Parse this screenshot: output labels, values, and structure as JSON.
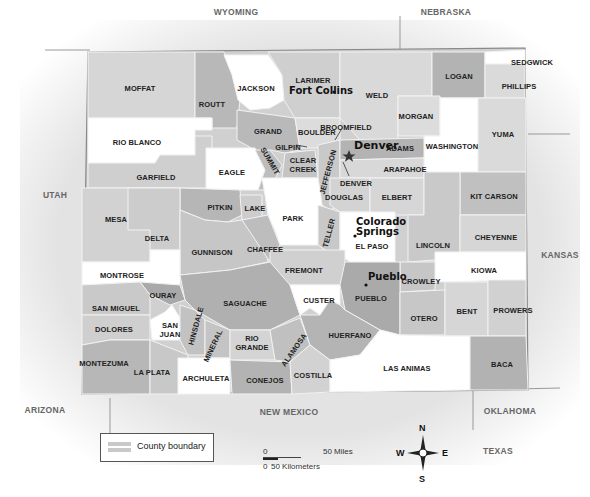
{
  "map": {
    "states": [
      {
        "name": "WYOMING",
        "x": 236,
        "y": 12
      },
      {
        "name": "NEBRASKA",
        "x": 446,
        "y": 12
      },
      {
        "name": "UTAH",
        "x": 55,
        "y": 195
      },
      {
        "name": "KANSAS",
        "x": 560,
        "y": 255
      },
      {
        "name": "ARIZONA",
        "x": 45,
        "y": 410
      },
      {
        "name": "NEW MEXICO",
        "x": 289,
        "y": 412
      },
      {
        "name": "OKLAHOMA",
        "x": 510,
        "y": 411
      },
      {
        "name": "TEXAS",
        "x": 498,
        "y": 451
      }
    ],
    "counties": [
      {
        "name": "MOFFAT",
        "x": 140,
        "y": 88
      },
      {
        "name": "JACKSON",
        "x": 256,
        "y": 88
      },
      {
        "name": "LARIMER",
        "x": 313,
        "y": 80
      },
      {
        "name": "WELD",
        "x": 377,
        "y": 95
      },
      {
        "name": "LOGAN",
        "x": 459,
        "y": 76
      },
      {
        "name": "SEDGWICK",
        "x": 532,
        "y": 62
      },
      {
        "name": "PHILLIPS",
        "x": 519,
        "y": 86
      },
      {
        "name": "ROUTT",
        "x": 212,
        "y": 104
      },
      {
        "name": "MORGAN",
        "x": 416,
        "y": 116
      },
      {
        "name": "RIO BLANCO",
        "x": 137,
        "y": 142
      },
      {
        "name": "GRAND",
        "x": 268,
        "y": 131
      },
      {
        "name": "BOULDER",
        "x": 317,
        "y": 132
      },
      {
        "name": "BROOMFIELD",
        "x": 346,
        "y": 127
      },
      {
        "name": "YUMA",
        "x": 503,
        "y": 134
      },
      {
        "name": "GILPIN",
        "x": 288,
        "y": 147
      },
      {
        "name": "ADAMS",
        "x": 400,
        "y": 148
      },
      {
        "name": "WASHINGTON",
        "x": 452,
        "y": 146
      },
      {
        "name": "CLEAR CREEK",
        "x": 303,
        "y": 165
      },
      {
        "name": "ARAPAHOE",
        "x": 405,
        "y": 169
      },
      {
        "name": "GARFIELD",
        "x": 156,
        "y": 177
      },
      {
        "name": "EAGLE",
        "x": 232,
        "y": 172
      },
      {
        "name": "DENVER",
        "x": 356,
        "y": 183
      },
      {
        "name": "DOUGLAS",
        "x": 344,
        "y": 197
      },
      {
        "name": "ELBERT",
        "x": 397,
        "y": 197
      },
      {
        "name": "KIT CARSON",
        "x": 494,
        "y": 196
      },
      {
        "name": "MESA",
        "x": 116,
        "y": 219
      },
      {
        "name": "PITKIN",
        "x": 220,
        "y": 207
      },
      {
        "name": "LAKE",
        "x": 255,
        "y": 208
      },
      {
        "name": "PARK",
        "x": 293,
        "y": 218
      },
      {
        "name": "DELTA",
        "x": 157,
        "y": 238
      },
      {
        "name": "GUNNISON",
        "x": 212,
        "y": 252
      },
      {
        "name": "CHAFFEE",
        "x": 265,
        "y": 249
      },
      {
        "name": "EL PASO",
        "x": 372,
        "y": 246
      },
      {
        "name": "LINCOLN",
        "x": 433,
        "y": 245
      },
      {
        "name": "CHEYENNE",
        "x": 496,
        "y": 237
      },
      {
        "name": "MONTROSE",
        "x": 122,
        "y": 275
      },
      {
        "name": "FREMONT",
        "x": 304,
        "y": 270
      },
      {
        "name": "KIOWA",
        "x": 484,
        "y": 270
      },
      {
        "name": "CROWLEY",
        "x": 421,
        "y": 281
      },
      {
        "name": "OURAY",
        "x": 163,
        "y": 295
      },
      {
        "name": "SAN MIGUEL",
        "x": 116,
        "y": 308
      },
      {
        "name": "SAGUACHE",
        "x": 245,
        "y": 303
      },
      {
        "name": "CUSTER",
        "x": 319,
        "y": 300
      },
      {
        "name": "PUEBLO",
        "x": 371,
        "y": 298
      },
      {
        "name": "BENT",
        "x": 467,
        "y": 311
      },
      {
        "name": "PROWERS",
        "x": 513,
        "y": 310
      },
      {
        "name": "DOLORES",
        "x": 114,
        "y": 329
      },
      {
        "name": "SAN JUAN",
        "x": 170,
        "y": 330
      },
      {
        "name": "OTERO",
        "x": 424,
        "y": 318
      },
      {
        "name": "HUERFANO",
        "x": 350,
        "y": 335
      },
      {
        "name": "RIO GRANDE",
        "x": 252,
        "y": 343
      },
      {
        "name": "MONTEZUMA",
        "x": 104,
        "y": 363
      },
      {
        "name": "LA PLATA",
        "x": 152,
        "y": 372
      },
      {
        "name": "ARCHULETA",
        "x": 206,
        "y": 378
      },
      {
        "name": "CONEJOS",
        "x": 265,
        "y": 380
      },
      {
        "name": "COSTILLA",
        "x": 313,
        "y": 375
      },
      {
        "name": "LAS ANIMAS",
        "x": 407,
        "y": 368
      },
      {
        "name": "BACA",
        "x": 502,
        "y": 364
      }
    ],
    "rotated_counties": [
      {
        "name": "SUMMIT",
        "x": 270,
        "y": 161,
        "rot": "60deg"
      },
      {
        "name": "JEFFERSON",
        "x": 328,
        "y": 172,
        "rot": "-75deg"
      },
      {
        "name": "TELLER",
        "x": 329,
        "y": 233,
        "rot": "-75deg"
      },
      {
        "name": "HINSDALE",
        "x": 196,
        "y": 326,
        "rot": "-75deg"
      },
      {
        "name": "MINERAL",
        "x": 213,
        "y": 346,
        "rot": "-65deg"
      },
      {
        "name": "ALAMOSA",
        "x": 294,
        "y": 350,
        "rot": "-55deg"
      }
    ],
    "cities": [
      {
        "name": "Fort Collins",
        "x": 288,
        "y": 90
      },
      {
        "name": "Denver",
        "x": 352,
        "y": 144
      },
      {
        "name": "Colorado Springs",
        "x": 354,
        "y": 219
      },
      {
        "name": "Pueblo",
        "x": 368,
        "y": 276
      }
    ],
    "colors": {
      "white": "#ffffff",
      "light": "#dcdcdc",
      "mid": "#c6c6c6",
      "dark": "#a9a9a9",
      "outside": "#e6e6e6",
      "border": "#9a9a9a"
    }
  },
  "legend": {
    "label": "County boundary"
  },
  "scale": {
    "miles_zero": "0",
    "miles_label": "50 Miles",
    "km_zero": "0",
    "km_label": "50 Kilometers"
  },
  "compass": {
    "n": "N",
    "s": "S",
    "e": "E",
    "w": "W"
  }
}
